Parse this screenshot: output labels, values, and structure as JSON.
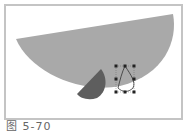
{
  "figure": {
    "caption": "图 5-70",
    "colors": {
      "frame_border": "#c4c4c4",
      "large_shape": "#a9a9a9",
      "small_shape": "#5e5e5e",
      "handles": "#222222",
      "background": "#ffffff"
    },
    "shapes": [
      {
        "name": "large-half-circle",
        "description": "large light-gray half-ellipse tilted"
      },
      {
        "name": "small-wedge",
        "description": "dark-gray semicircle segment"
      },
      {
        "name": "selection-box",
        "description": "selected path with 8 transform handles"
      }
    ]
  }
}
